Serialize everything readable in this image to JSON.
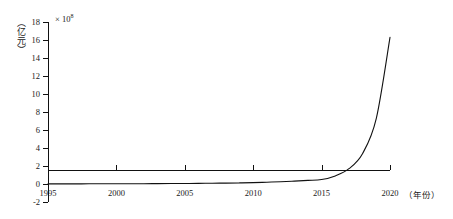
{
  "chart_data": {
    "type": "line",
    "title": "",
    "subtitle": "",
    "xlabel": "（年份）",
    "ylabel": "（亿元）",
    "y_multiplier": "× 10",
    "y_multiplier_exponent": "8",
    "xlim": [
      1995,
      2020
    ],
    "ylim": [
      -2,
      18
    ],
    "xticks": [
      1995,
      2000,
      2005,
      2010,
      2015,
      2020
    ],
    "xtick_labels": [
      "1995",
      "2000",
      "2005",
      "2010",
      "2015",
      "2020"
    ],
    "yticks": [
      -2,
      0,
      2,
      4,
      6,
      8,
      10,
      12,
      14,
      16,
      18
    ],
    "ytick_labels": [
      "-2",
      "0",
      "2",
      "4",
      "6",
      "8",
      "10",
      "12",
      "14",
      "16",
      "18"
    ],
    "grid": false,
    "legend": "none",
    "line_color": "#111111",
    "line_width": 1.1,
    "series": [
      {
        "name": "",
        "x": [
          1995,
          1996,
          1997,
          1998,
          1999,
          2000,
          2001,
          2002,
          2003,
          2004,
          2005,
          2006,
          2007,
          2008,
          2009,
          2010,
          2011,
          2012,
          2013,
          2014,
          2015,
          2016,
          2017,
          2018,
          2019,
          2020
        ],
        "values": [
          0.01,
          0.01,
          0.01,
          0.02,
          0.02,
          0.02,
          0.03,
          0.03,
          0.04,
          0.05,
          0.06,
          0.07,
          0.09,
          0.1,
          0.12,
          0.15,
          0.2,
          0.25,
          0.32,
          0.4,
          0.5,
          0.9,
          1.7,
          3.4,
          7.3,
          16.3
        ]
      }
    ]
  },
  "axes": {
    "y_title": "（亿元）",
    "y_multiplier_base": "× 10",
    "y_multiplier_exp": "8",
    "x_title": "（年份）"
  }
}
